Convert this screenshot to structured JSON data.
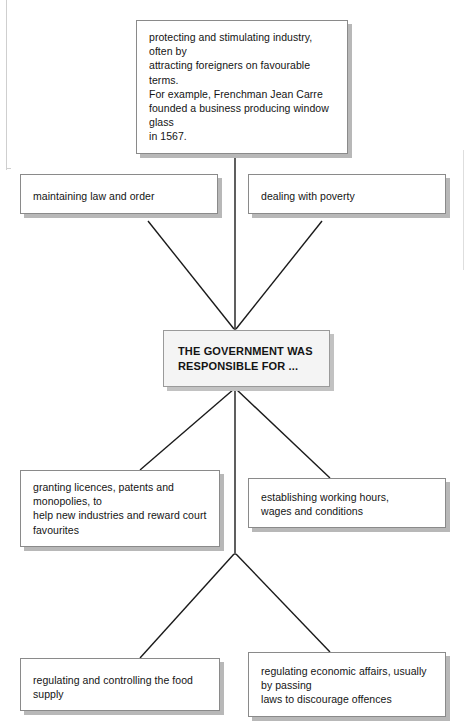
{
  "diagram": {
    "type": "spider-diagram",
    "center": {
      "id": "central",
      "text": "THE GOVERNMENT WAS RESPONSIBLE FOR ...",
      "line1": "THE GOVERNMENT WAS",
      "line2": "RESPONSIBLE FOR ...",
      "fill": "#f4f4f4",
      "border": "#9a9a9a"
    },
    "branches": [
      {
        "id": "industry",
        "position": "top",
        "text": "protecting and stimulating industry, often by attracting foreigners on favourable terms. For example, Frenchman Jean Carre founded a business producing window glass in 1567.",
        "lines": [
          "protecting and stimulating industry, often by",
          "attracting foreigners on favourable terms.",
          "For example, Frenchman Jean Carre",
          "founded a business producing window glass",
          "in 1567."
        ]
      },
      {
        "id": "law-order",
        "position": "upper-left",
        "text": "maintaining law and order",
        "lines": [
          "maintaining law and order"
        ]
      },
      {
        "id": "poverty",
        "position": "upper-right",
        "text": "dealing with poverty",
        "lines": [
          "dealing with poverty"
        ]
      },
      {
        "id": "licences",
        "position": "lower-left",
        "text": "granting licences, patents and monopolies, to help new industries and reward court favourites",
        "lines": [
          "granting licences, patents and monopolies, to",
          "help new industries and reward court",
          "favourites"
        ]
      },
      {
        "id": "working-hours",
        "position": "lower-right",
        "text": "establishing working hours, wages and conditions",
        "lines": [
          "establishing working hours,",
          "wages and conditions"
        ]
      },
      {
        "id": "food-supply",
        "position": "bottom-left",
        "text": "regulating and controlling the food supply",
        "lines": [
          "regulating and controlling the food supply"
        ]
      },
      {
        "id": "economic-affairs",
        "position": "bottom-right",
        "text": "regulating economic affairs, usually by passing laws to discourage offences",
        "lines": [
          "regulating economic affairs, usually by passing",
          "laws to discourage offences"
        ]
      }
    ],
    "colors": {
      "connector": "#1a1a1a",
      "box_border": "#8a8a8a",
      "box_shadow": "#b8b8b8",
      "box_fill": "#ffffff",
      "text": "#141414"
    }
  }
}
